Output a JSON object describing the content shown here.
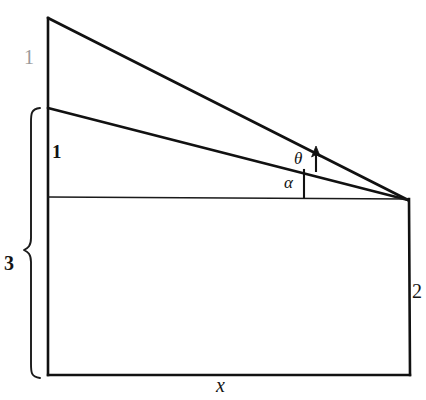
{
  "figure": {
    "background_color": "#ffffff",
    "stroke_color": "#111111",
    "canvas": {
      "width": 426,
      "height": 400
    }
  },
  "labels": {
    "top_segment": "1",
    "middle_segment": "1",
    "brace_total": "3",
    "right_side": "2",
    "base": "x",
    "angle_theta": "θ",
    "angle_alpha": "α"
  },
  "label_colors": {
    "top_segment": "#9a9a9a",
    "middle_segment": "#111111",
    "brace_total": "#151515",
    "right_side": "#151515",
    "base": "#151515",
    "angles": "#121212"
  },
  "geometry": {
    "apex": {
      "x": 48,
      "y": 18
    },
    "middle_vertex": {
      "x": 48,
      "y": 108
    },
    "baseline_vertex": {
      "x": 48,
      "y": 197
    },
    "bottom_left": {
      "x": 48,
      "y": 375
    },
    "bottom_right": {
      "x": 410,
      "y": 375
    },
    "convergence_point": {
      "x": 408,
      "y": 200
    },
    "brace_top": {
      "x": 30,
      "y": 108
    },
    "brace_bottom": {
      "x": 30,
      "y": 378
    },
    "brace_notch_y": 250
  },
  "annotations": {
    "theta_arrow": "upward-arrow-between-upper-and-middle-line",
    "alpha_tick": "vertical-tick-between-baseline-and-middle-line"
  }
}
